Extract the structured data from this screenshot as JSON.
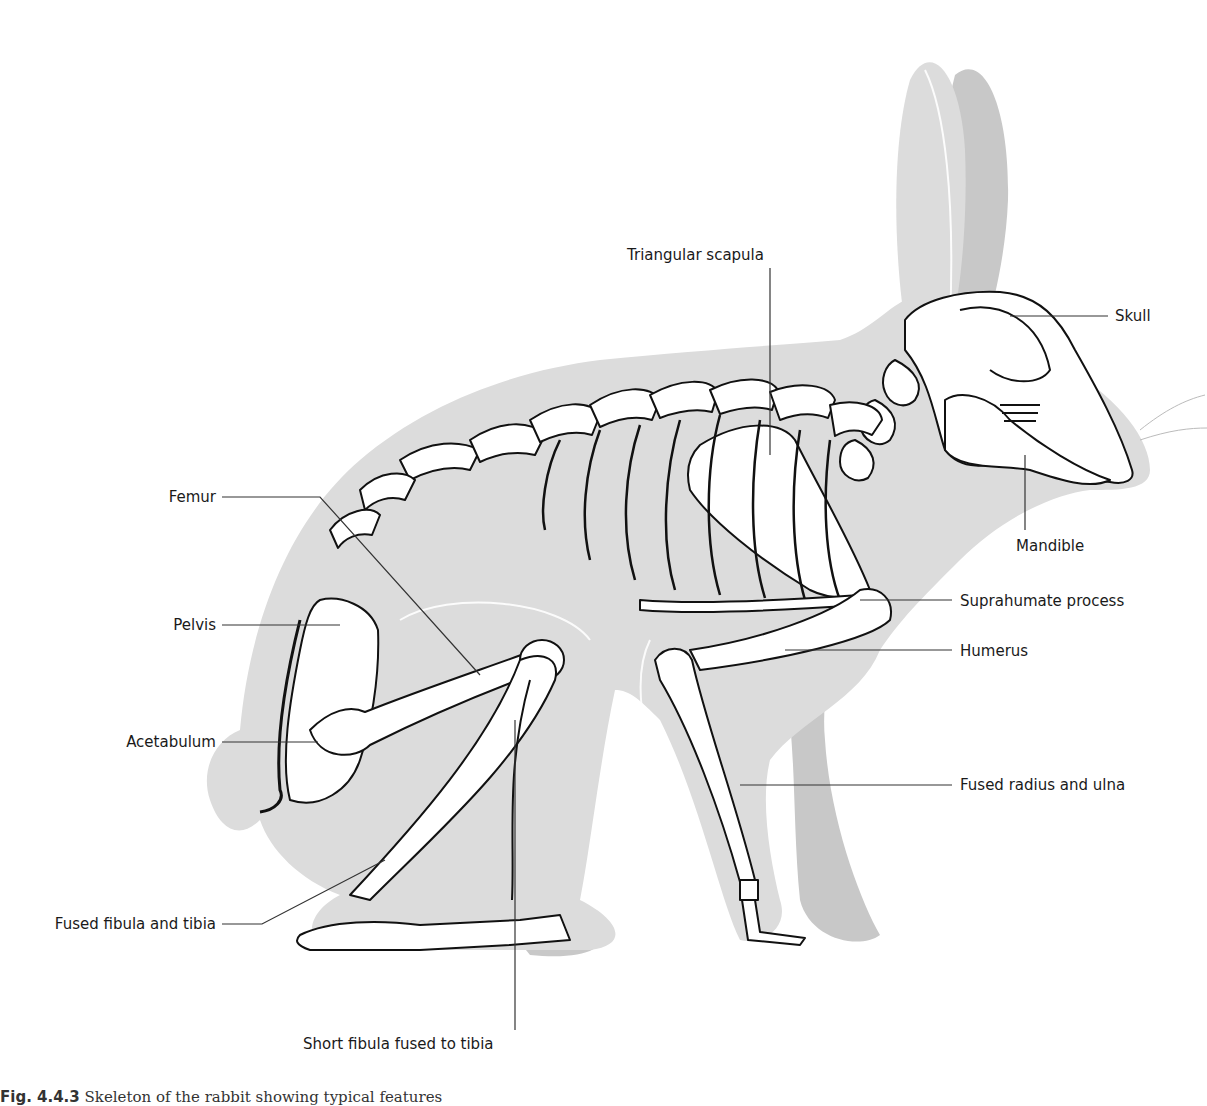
{
  "figure": {
    "colors": {
      "background": "#ffffff",
      "silhouette": "#dcdcdc",
      "shadow": "#c8c8c8",
      "bone_fill": "#ffffff",
      "outline": "#111111",
      "leader": "#333333"
    },
    "caption": {
      "number": "Fig. 4.4.3",
      "text": "Skeleton of the rabbit showing typical features"
    }
  },
  "labels": {
    "triangular_scapula": "Triangular scapula",
    "skull": "Skull",
    "mandible": "Mandible",
    "femur": "Femur",
    "pelvis": "Pelvis",
    "suprahumate_process": "Suprahumate process",
    "humerus": "Humerus",
    "acetabulum": "Acetabulum",
    "fused_radius_ulna": "Fused radius and ulna",
    "fused_fibula_tibia": "Fused fibula and tibia",
    "short_fibula": "Short fibula fused to tibia"
  }
}
